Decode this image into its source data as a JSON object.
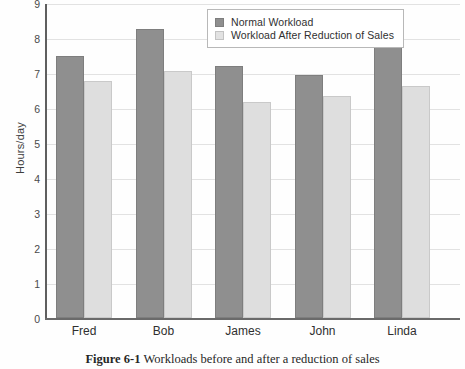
{
  "chart_data": {
    "type": "bar",
    "title": "",
    "xlabel": "",
    "ylabel": "Hours/day",
    "categories": [
      "Fred",
      "Bob",
      "James",
      "John",
      "Linda"
    ],
    "series": [
      {
        "name": "Normal Workload",
        "values": [
          7.5,
          8.27,
          7.2,
          6.95,
          8.07
        ],
        "color": "#8f8f8f"
      },
      {
        "name": "Workload After Reduction of Sales",
        "values": [
          6.78,
          7.05,
          6.18,
          6.33,
          6.62
        ],
        "color": "#dedede"
      }
    ],
    "ylim": [
      0,
      9
    ],
    "yticks": [
      0,
      1,
      2,
      3,
      4,
      5,
      6,
      7,
      8,
      9
    ],
    "ytick_labels": [
      "0",
      "1",
      "2",
      "3",
      "4",
      "5",
      "6",
      "7",
      "8",
      "9"
    ],
    "grid": true,
    "legend_position": "top-center"
  },
  "caption": {
    "number": "Figure 6-1",
    "text": "Workloads before and after a reduction of sales"
  }
}
